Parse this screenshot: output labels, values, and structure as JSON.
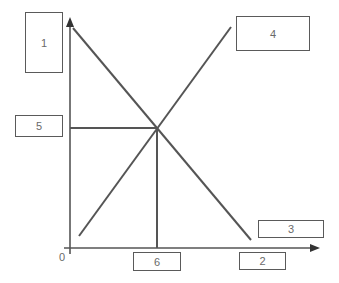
{
  "diagram": {
    "type": "supply-demand",
    "colors": {
      "line": "#555555",
      "box_border": "#5a5a5a",
      "text": "#6a6a6a",
      "background": "#ffffff"
    },
    "origin_label": "0",
    "boxes": [
      {
        "id": "1",
        "label": "1",
        "x": 25,
        "y": 12,
        "w": 38,
        "h": 61
      },
      {
        "id": "4",
        "label": "4",
        "x": 236,
        "y": 16,
        "w": 74,
        "h": 35
      },
      {
        "id": "5",
        "label": "5",
        "x": 15,
        "y": 115,
        "w": 48,
        "h": 22
      },
      {
        "id": "3",
        "label": "3",
        "x": 258,
        "y": 220,
        "w": 66,
        "h": 18
      },
      {
        "id": "2",
        "label": "2",
        "x": 239,
        "y": 252,
        "w": 47,
        "h": 18
      },
      {
        "id": "6",
        "label": "6",
        "x": 133,
        "y": 252,
        "w": 48,
        "h": 19
      }
    ],
    "axes": {
      "y_axis": {
        "x": 70,
        "y_top": 18,
        "y_bottom": 254
      },
      "x_axis": {
        "y": 248,
        "x_left": 64,
        "x_right": 318
      }
    },
    "lines": [
      {
        "name": "downward-sloping-line",
        "x1": 73,
        "y1": 28,
        "x2": 251,
        "y2": 240
      },
      {
        "name": "upward-sloping-line",
        "x1": 79,
        "y1": 236,
        "x2": 231,
        "y2": 27
      }
    ],
    "equilibrium": {
      "x": 157,
      "y": 128
    }
  }
}
